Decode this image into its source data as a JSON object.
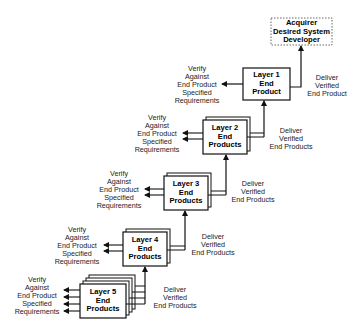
{
  "diagram": {
    "type": "layered-product-realization",
    "acquirer": {
      "lines": [
        "Acquirer",
        "Desired System",
        "Developer"
      ],
      "border": "dashed"
    },
    "layers": [
      {
        "id": 1,
        "box": [
          "Layer 1",
          "End",
          "Product"
        ],
        "verify": [
          "Verify",
          "Against",
          "End Product",
          "Specified",
          "Requirements"
        ],
        "deliver": [
          "Deliver",
          "Verified",
          "End Product"
        ],
        "stack_count": 1
      },
      {
        "id": 2,
        "box": [
          "Layer 2",
          "End",
          "Products"
        ],
        "verify": [
          "Verify",
          "Against",
          "End Product",
          "Specified",
          "Requirements"
        ],
        "deliver": [
          "Deliver",
          "Verified",
          "End Products"
        ],
        "stack_count": 2
      },
      {
        "id": 3,
        "box": [
          "Layer 3",
          "End",
          "Products"
        ],
        "verify": [
          "Verify",
          "Against",
          "End Product",
          "Specified",
          "Requirements"
        ],
        "deliver": [
          "Deliver",
          "Verified",
          "End Products"
        ],
        "stack_count": 2
      },
      {
        "id": 4,
        "box": [
          "Layer 4",
          "End",
          "Products"
        ],
        "verify": [
          "Verify",
          "Against",
          "End Product",
          "Specified",
          "Requirements"
        ],
        "deliver": [
          "Deliver",
          "Verified",
          "End Products"
        ],
        "stack_count": 2
      },
      {
        "id": 5,
        "box": [
          "Layer 5",
          "End",
          "Products"
        ],
        "verify": [
          "Verify",
          "Against",
          "End Product",
          "Specified",
          "Requirements"
        ],
        "deliver": [
          "Deliver",
          "Verified",
          "End Products"
        ],
        "stack_count": 4
      }
    ],
    "colors": {
      "line": "#111111",
      "background": "#ffffff",
      "dashed_border": "#666666"
    }
  }
}
